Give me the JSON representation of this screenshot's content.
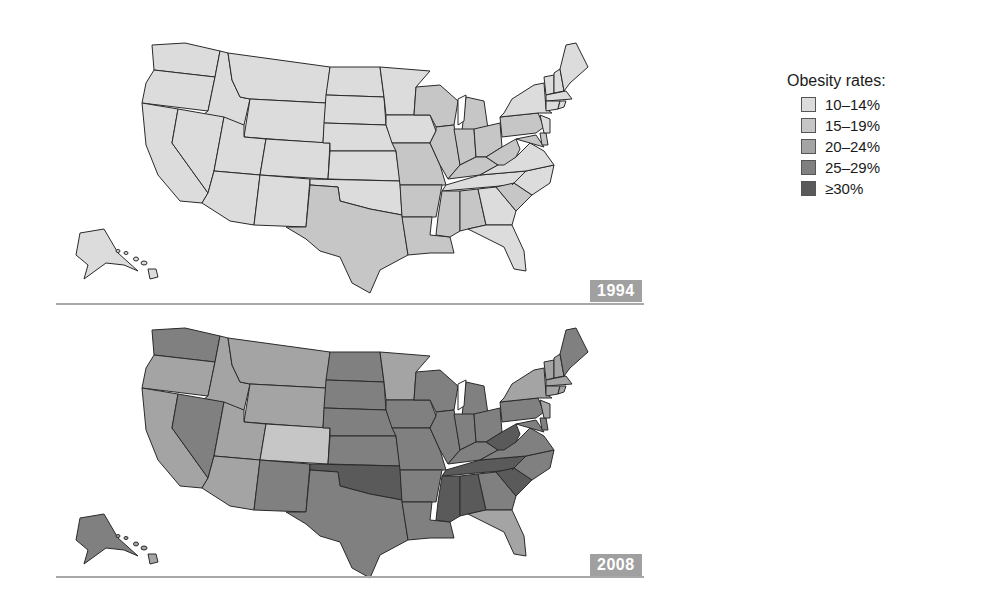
{
  "legend": {
    "title": "Obesity rates:",
    "items": [
      {
        "label": "10–14%",
        "color": "#dcdcdc"
      },
      {
        "label": "15–19%",
        "color": "#c6c6c6"
      },
      {
        "label": "20–24%",
        "color": "#a4a4a4"
      },
      {
        "label": "25–29%",
        "color": "#808080"
      },
      {
        "label": "≥30%",
        "color": "#5a5a5a"
      }
    ]
  },
  "maps": [
    {
      "year_label": "1994"
    },
    {
      "year_label": "2008"
    }
  ],
  "map_data": {
    "type": "choropleth",
    "subject": "US adult obesity rates by state",
    "classes": [
      "10–14%",
      "15–19%",
      "20–24%",
      "25–29%",
      "≥30%"
    ],
    "1994": {
      "class_10_14": [
        "WA",
        "OR",
        "CA",
        "ID",
        "NV",
        "MT",
        "WY",
        "UT",
        "CO",
        "AZ",
        "NM",
        "ND",
        "SD",
        "NE",
        "KS",
        "OK",
        "MN",
        "IA",
        "ME",
        "NH",
        "VT",
        "NY",
        "MA",
        "CT",
        "RI",
        "NJ",
        "GA",
        "FL",
        "TN",
        "VA",
        "NC",
        "AK",
        "HI"
      ],
      "class_15_19": [
        "TX",
        "MO",
        "AR",
        "LA",
        "MS",
        "AL",
        "WI",
        "MI",
        "IL",
        "IN",
        "OH",
        "KY",
        "WV",
        "PA",
        "SC",
        "DE",
        "MD"
      ]
    },
    "2008": {
      "class_15_19": [
        "CO"
      ],
      "class_20_24": [
        "OR",
        "CA",
        "ID",
        "MT",
        "WY",
        "UT",
        "AZ",
        "MN",
        "NY",
        "VT",
        "NH",
        "MA",
        "CT",
        "RI",
        "NJ",
        "FL",
        "HI"
      ],
      "class_25_29": [
        "WA",
        "NV",
        "NM",
        "TX",
        "ND",
        "SD",
        "NE",
        "KS",
        "IA",
        "MO",
        "AR",
        "LA",
        "WI",
        "MI",
        "IL",
        "IN",
        "OH",
        "KY",
        "PA",
        "VA",
        "NC",
        "GA",
        "ME",
        "DE",
        "MD",
        "AK"
      ],
      "class_30_plus": [
        "OK",
        "TN",
        "MS",
        "AL",
        "SC",
        "WV"
      ]
    }
  }
}
